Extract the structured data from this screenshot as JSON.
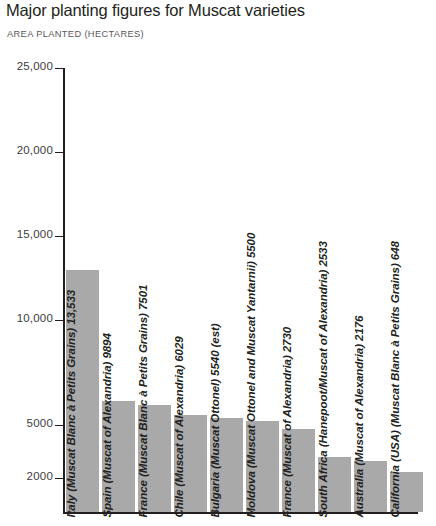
{
  "header": {
    "title": "Major planting figures for Muscat varieties",
    "subtitle": "AREA PLANTED (HECTARES)"
  },
  "colors": {
    "bar_fill": "#a9a9a9",
    "axis": "#231f20",
    "title_text": "#231f20",
    "subtitle_text": "#58585a",
    "tick_text": "#3c3c3c",
    "background": "#ffffff"
  },
  "chart_data": {
    "type": "bar",
    "title": "Major planting figures for Muscat varieties",
    "subtitle": "AREA PLANTED (HECTARES)",
    "xlabel": "",
    "ylabel": "AREA PLANTED (HECTARES)",
    "ytick_labels": [
      "25,000",
      "20,000",
      "15,000",
      "10,000",
      "5000",
      "2000"
    ],
    "ytick_values": [
      25000,
      20000,
      15000,
      10000,
      5000,
      2000
    ],
    "ylim": [
      0,
      25000
    ],
    "grid": false,
    "legend": null,
    "axis_note": "vertical scale is broken/non-linear below 5000",
    "categories": [
      "Italy (Muscat Blanc à Petits Grains)",
      "Spain (Muscat of Alexandria)",
      "France (Muscat Blanc à Petits Grains)",
      "Chile (Muscat of Alexandria)",
      "Bulgaria (Muscat Ottonel)",
      "Moldova (Muscat Ottonel and Muscat Yantarnii)",
      "France (Muscat of Alexandria)",
      "South Africa (Hanepoot/Muscat of Alexandria)",
      "Australia (Muscat of Alexandria)",
      "California (USA) (Muscat Blanc à Petits Grains)"
    ],
    "values": [
      13533,
      9894,
      7501,
      6029,
      5540,
      5500,
      2730,
      2533,
      2176,
      648
    ],
    "value_labels": [
      "13,533",
      "9894",
      "7501",
      "6029",
      "5540 (est)",
      "5500",
      "2730",
      "2533",
      "2176",
      "648"
    ],
    "bars": [
      {
        "label": "Italy (Muscat Blanc à Petits Grains) 13,533",
        "value": 13533,
        "country": "Italy",
        "variety": "Muscat Blanc à Petits Grains",
        "value_text": "13,533"
      },
      {
        "label": "Spain (Muscat of Alexandria) 9894",
        "value": 9894,
        "country": "Spain",
        "variety": "Muscat of Alexandria",
        "value_text": "9894"
      },
      {
        "label": "France (Muscat Blanc à Petits Grains) 7501",
        "value": 7501,
        "country": "France",
        "variety": "Muscat Blanc à Petits Grains",
        "value_text": "7501"
      },
      {
        "label": "Chile (Muscat of Alexandria) 6029",
        "value": 6029,
        "country": "Chile",
        "variety": "Muscat of Alexandria",
        "value_text": "6029"
      },
      {
        "label": "Bulgaria (Muscat Ottonel) 5540 (est)",
        "value": 5540,
        "country": "Bulgaria",
        "variety": "Muscat Ottonel",
        "value_text": "5540 (est)"
      },
      {
        "label": "Moldova (Muscat Ottonel and Muscat Yantarnii) 5500",
        "value": 5500,
        "country": "Moldova",
        "variety": "Muscat Ottonel and Muscat Yantarnii",
        "value_text": "5500"
      },
      {
        "label": "France (Muscat of Alexandria) 2730",
        "value": 2730,
        "country": "France",
        "variety": "Muscat of Alexandria",
        "value_text": "2730"
      },
      {
        "label": "South Africa (Hanepoot/Muscat of Alexandria) 2533",
        "value": 2533,
        "country": "South Africa",
        "variety": "Hanepoot/Muscat of Alexandria",
        "value_text": "2533"
      },
      {
        "label": "Australia (Muscat of Alexandria) 2176",
        "value": 2176,
        "country": "Australia",
        "variety": "Muscat of Alexandria",
        "value_text": "2176"
      },
      {
        "label": "California (USA) (Muscat Blanc à Petits Grains) 648",
        "value": 648,
        "country": "California (USA)",
        "variety": "Muscat Blanc à Petits Grains",
        "value_text": "648"
      }
    ]
  },
  "geometry": {
    "plot_left": 66,
    "plot_baseline": 512,
    "bar_width": 33,
    "bar_pitch": 36,
    "tick_y": {
      "25000": 68,
      "20000": 152,
      "15000": 236,
      "10000": 320,
      "5000": 425,
      "2000": 478
    },
    "bar_top_y": [
      270,
      401,
      405,
      415,
      418,
      421,
      429,
      457,
      461,
      472
    ],
    "label_baseline_y": 506
  }
}
